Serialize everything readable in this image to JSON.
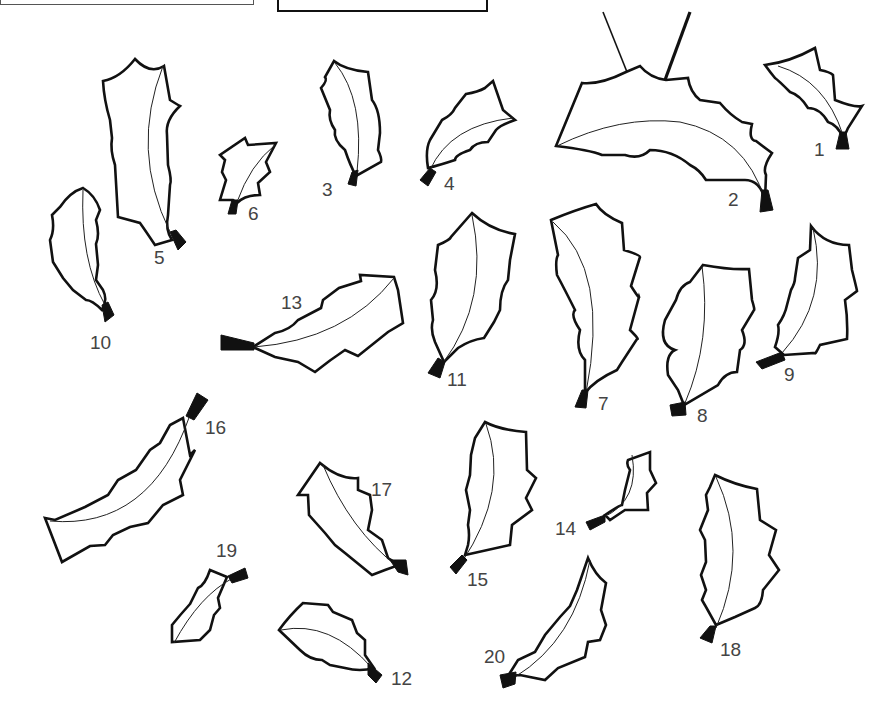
{
  "page": {
    "background": "#ffffff",
    "line_color": "#111111",
    "label_color": "#444444"
  },
  "top_box": {
    "visible": true
  },
  "sign": {
    "visible": true,
    "hung_from": "leaf-2"
  },
  "leaves": [
    {
      "id": 1,
      "label": "1",
      "label_x": 814,
      "label_y": 140
    },
    {
      "id": 2,
      "label": "2",
      "label_x": 728,
      "label_y": 190
    },
    {
      "id": 3,
      "label": "3",
      "label_x": 322,
      "label_y": 180
    },
    {
      "id": 4,
      "label": "4",
      "label_x": 444,
      "label_y": 174
    },
    {
      "id": 5,
      "label": "5",
      "label_x": 154,
      "label_y": 248
    },
    {
      "id": 6,
      "label": "6",
      "label_x": 248,
      "label_y": 204
    },
    {
      "id": 7,
      "label": "7",
      "label_x": 598,
      "label_y": 394
    },
    {
      "id": 8,
      "label": "8",
      "label_x": 697,
      "label_y": 406
    },
    {
      "id": 9,
      "label": "9",
      "label_x": 784,
      "label_y": 365
    },
    {
      "id": 10,
      "label": "10",
      "label_x": 90,
      "label_y": 333
    },
    {
      "id": 11,
      "label": "11",
      "label_x": 447,
      "label_y": 370
    },
    {
      "id": 12,
      "label": "12",
      "label_x": 391,
      "label_y": 669
    },
    {
      "id": 13,
      "label": "13",
      "label_x": 281,
      "label_y": 293
    },
    {
      "id": 14,
      "label": "14",
      "label_x": 555,
      "label_y": 519
    },
    {
      "id": 15,
      "label": "15",
      "label_x": 467,
      "label_y": 570
    },
    {
      "id": 16,
      "label": "16",
      "label_x": 205,
      "label_y": 418
    },
    {
      "id": 17,
      "label": "17",
      "label_x": 371,
      "label_y": 480
    },
    {
      "id": 18,
      "label": "18",
      "label_x": 720,
      "label_y": 640
    },
    {
      "id": 19,
      "label": "19",
      "label_x": 216,
      "label_y": 541
    },
    {
      "id": 20,
      "label": "20",
      "label_x": 484,
      "label_y": 647
    }
  ]
}
